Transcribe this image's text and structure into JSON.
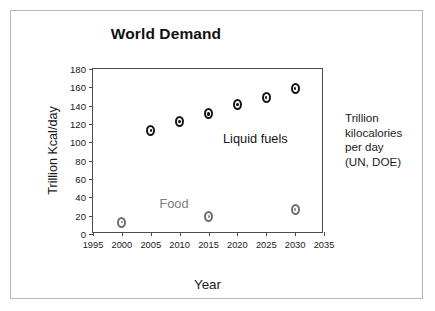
{
  "chart_data": {
    "type": "scatter",
    "title": "World Demand",
    "xlabel": "Year",
    "ylabel": "Trillion Kcal/day",
    "xlim": [
      1995,
      2035
    ],
    "ylim": [
      0,
      180
    ],
    "xticks": [
      1995,
      2000,
      2005,
      2010,
      2015,
      2020,
      2025,
      2030,
      2035
    ],
    "yticks": [
      0,
      20,
      40,
      60,
      80,
      100,
      120,
      140,
      160,
      180
    ],
    "grid": false,
    "legend_position": "in-plot annotations",
    "series": [
      {
        "name": "Liquid fuels",
        "marker": "open-circle-dark",
        "color": "#151515",
        "x": [
          2005,
          2010,
          2015,
          2020,
          2025,
          2030
        ],
        "values": [
          113,
          123,
          131,
          141,
          149,
          159
        ]
      },
      {
        "name": "Food",
        "marker": "open-circle-light",
        "color": "#6e6e6e",
        "x": [
          2000,
          2015,
          2030
        ],
        "values": [
          13,
          19,
          27
        ]
      }
    ],
    "annotations": [
      {
        "text": "Food",
        "x": 2006.5,
        "y": 42,
        "color": "#7d7d7d"
      },
      {
        "text": "Liquid fuels",
        "x": 2017.5,
        "y": 112,
        "color": "#161616"
      }
    ],
    "side_note": [
      "Trillion",
      "kilocalories",
      "per day",
      "(UN, DOE)"
    ]
  },
  "labels": {
    "title": "World Demand",
    "x_axis_title": "Year",
    "y_axis_title": "Trillion Kcal/day",
    "food_label": "Food",
    "liquid_fuels_label": "Liquid fuels"
  },
  "colors": {
    "frame_border": "#b9b9b9",
    "axis": "#4b4b4b",
    "liquid_fuels_marker": "#151515",
    "food_marker": "#6e6e6e",
    "text": "#1a1a1a"
  }
}
